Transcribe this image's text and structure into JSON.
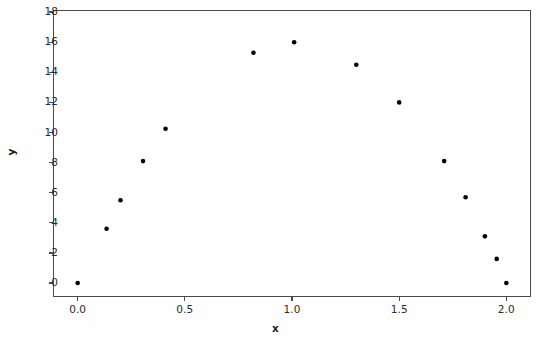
{
  "figure": {
    "background_color": "#fefefe",
    "plot_background_color": "#ffffff",
    "frame_color": "#4a4a4a"
  },
  "axis": {
    "xlabel": "x",
    "ylabel": "y",
    "x_ticks": [
      "0.0",
      "0.5",
      "1.0",
      "1.5",
      "2.0"
    ],
    "y_ticks": [
      "0",
      "2",
      "4",
      "6",
      "8",
      "10",
      "12",
      "14",
      "16",
      "18"
    ]
  },
  "chart_data": {
    "type": "scatter",
    "title": "",
    "xlabel": "x",
    "ylabel": "y",
    "xlim": [
      -0.115,
      2.115
    ],
    "ylim": [
      -0.93,
      18.14
    ],
    "xticks": [
      0.0,
      0.5,
      1.0,
      1.5,
      2.0
    ],
    "yticks": [
      0,
      2,
      4,
      6,
      8,
      10,
      12,
      14,
      16,
      18
    ],
    "grid": false,
    "legend": null,
    "marker": {
      "shape": "circle",
      "color": "#000000",
      "size": 4.6
    },
    "series": [
      {
        "name": "data",
        "x": [
          0.0,
          0.135,
          0.2,
          0.305,
          0.41,
          0.82,
          1.01,
          1.3,
          1.5,
          1.71,
          1.81,
          1.9,
          1.955,
          2.0
        ],
        "y": [
          0.0,
          3.6,
          5.5,
          8.1,
          10.25,
          15.3,
          16.0,
          14.5,
          12.0,
          8.1,
          5.7,
          3.1,
          1.6,
          0.0
        ]
      }
    ]
  }
}
